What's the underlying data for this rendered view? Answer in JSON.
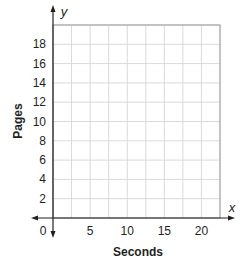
{
  "chart_data": {
    "type": "line",
    "title": "",
    "xlabel": "Seconds",
    "ylabel": "Pages",
    "x_axis_variable": "x",
    "y_axis_variable": "y",
    "origin_label": "0",
    "x_ticks": [
      5,
      10,
      15,
      20
    ],
    "y_ticks": [
      2,
      4,
      6,
      8,
      10,
      12,
      14,
      16,
      18
    ],
    "xlim": [
      0,
      22.5
    ],
    "ylim": [
      0,
      20
    ],
    "x_grid_step": 2.5,
    "y_grid_step": 2,
    "grid": true,
    "legend": null,
    "series": [],
    "colors": {
      "grid": "#d9d9d9",
      "axis": "#231f20",
      "border": "#9a9a9a"
    }
  }
}
